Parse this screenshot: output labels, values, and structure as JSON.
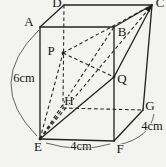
{
  "figure": {
    "background": "#f3f3ef",
    "stroke_color": "#242424",
    "vertices": {
      "A": {
        "x": 40,
        "y": 27
      },
      "B": {
        "x": 114,
        "y": 27
      },
      "C": {
        "x": 152,
        "y": 5
      },
      "D": {
        "x": 64,
        "y": 5
      },
      "E": {
        "x": 40,
        "y": 139
      },
      "F": {
        "x": 114,
        "y": 141
      },
      "G": {
        "x": 143,
        "y": 110
      },
      "H": {
        "x": 63,
        "y": 108
      },
      "P": {
        "x": 63,
        "y": 53
      },
      "Q": {
        "x": 114,
        "y": 77
      }
    },
    "solid_segments": [
      [
        "A",
        "B"
      ],
      [
        "B",
        "F"
      ],
      [
        "F",
        "E"
      ],
      [
        "E",
        "A"
      ],
      [
        "A",
        "D"
      ],
      [
        "D",
        "C"
      ],
      [
        "B",
        "C"
      ],
      [
        "C",
        "G"
      ],
      [
        "F",
        "G"
      ],
      [
        "E",
        "Q"
      ],
      [
        "Q",
        "C"
      ]
    ],
    "dashed_segments": [
      [
        "D",
        "H"
      ],
      [
        "H",
        "G"
      ],
      [
        "E",
        "H"
      ],
      [
        "E",
        "P"
      ],
      [
        "P",
        "C"
      ],
      [
        "P",
        "Q"
      ],
      [
        "E",
        "B"
      ],
      [
        "E",
        "C"
      ]
    ],
    "arrow_segment": [
      "E",
      "C"
    ],
    "dots": [
      "E",
      "P",
      "Q"
    ],
    "labels": [
      {
        "text": "A",
        "x": 29,
        "y": 23
      },
      {
        "text": "B",
        "x": 122,
        "y": 33
      },
      {
        "text": "C",
        "x": 160,
        "y": 4
      },
      {
        "text": "D",
        "x": 57,
        "y": 4
      },
      {
        "text": "E",
        "x": 38,
        "y": 148
      },
      {
        "text": "F",
        "x": 120,
        "y": 150
      },
      {
        "text": "G",
        "x": 150,
        "y": 107
      },
      {
        "text": "H",
        "x": 69,
        "y": 102
      },
      {
        "text": "P",
        "x": 51,
        "y": 52
      },
      {
        "text": "Q",
        "x": 122,
        "y": 80
      }
    ],
    "dimensions": [
      {
        "text": "6cm",
        "x": 24,
        "y": 79,
        "arc": "M 39,30 Q -16,83 37,136"
      },
      {
        "text": "4cm",
        "x": 81,
        "y": 147,
        "arc": "M 46,143 Q 80,153 110,144"
      },
      {
        "text": "4cm",
        "x": 152,
        "y": 127,
        "arc": "M 154,114 Q 150,138 118,145"
      }
    ]
  }
}
